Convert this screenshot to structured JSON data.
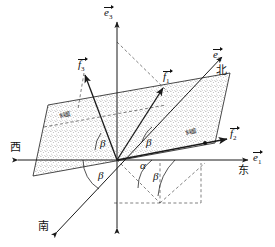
{
  "figure": {
    "type": "geometry-diagram",
    "width": 275,
    "height": 247,
    "background": "#ffffff",
    "stroke_color": "#1a1a1a",
    "plane_fill": "#d8d8d8",
    "dash_color": "#444444"
  },
  "axes": [
    {
      "id": "e1",
      "symbol": "e",
      "subscript": "1",
      "label_cjk": "东",
      "label_cjk_meaning": "East",
      "direction": "right",
      "arrowheads": "both"
    },
    {
      "id": "e2",
      "symbol": "e",
      "subscript": "2",
      "label_cjk": "北",
      "label_cjk_meaning": "North",
      "direction": "up-right",
      "arrowheads": "both"
    },
    {
      "id": "e3",
      "symbol": "e",
      "subscript": "3",
      "label_cjk": "",
      "label_cjk_meaning": "Up",
      "direction": "up",
      "arrowheads": "both"
    }
  ],
  "compass": {
    "east": "东",
    "west": "西",
    "north": "北",
    "south": "南"
  },
  "vectors": [
    {
      "id": "f1",
      "symbol": "f",
      "subscript": "1",
      "direction": "up-right"
    },
    {
      "id": "f2",
      "symbol": "f",
      "subscript": "2",
      "direction": "right-slightly-up"
    },
    {
      "id": "f3",
      "symbol": "f",
      "subscript": "3",
      "direction": "up-left"
    }
  ],
  "angles": [
    {
      "id": "angle-beta-upper-left",
      "symbol": "β"
    },
    {
      "id": "angle-beta-upper-right",
      "symbol": "β"
    },
    {
      "id": "angle-beta-lower-left",
      "symbol": "β"
    },
    {
      "id": "angle-beta-lower-right",
      "symbol": "β"
    },
    {
      "id": "angle-alpha",
      "symbol": "α"
    }
  ],
  "plane_labels": [
    {
      "id": "plane-label-left",
      "text": "斜面"
    },
    {
      "id": "plane-label-right",
      "text": "斜面"
    }
  ]
}
